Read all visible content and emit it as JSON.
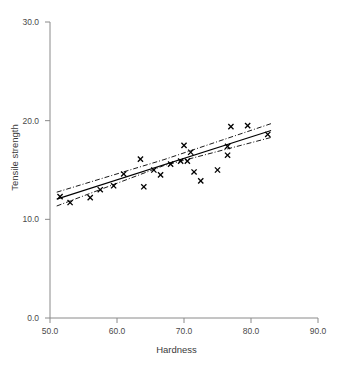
{
  "chart_data": {
    "type": "scatter",
    "title": "",
    "xlabel": "Hardness",
    "ylabel": "Tensile strength",
    "xlim": [
      50.0,
      90.0
    ],
    "ylim": [
      0.0,
      30.0
    ],
    "xticks": [
      "50.0",
      "60.0",
      "70.0",
      "80.0",
      "90.0"
    ],
    "yticks": [
      "0.0",
      "10.0",
      "20.0",
      "30.0"
    ],
    "xtick_values": [
      50,
      60,
      70,
      80,
      90
    ],
    "ytick_values": [
      0,
      10,
      20,
      30
    ],
    "grid": false,
    "legend": false,
    "marker": "x-cross",
    "marker_color": "#000000",
    "fit_line_color": "#000000",
    "band_color": "#000000",
    "band_style": "dash-dot",
    "points": [
      {
        "x": 51.5,
        "y": 12.3
      },
      {
        "x": 53.0,
        "y": 11.7
      },
      {
        "x": 56.0,
        "y": 12.2
      },
      {
        "x": 57.5,
        "y": 13.0
      },
      {
        "x": 59.5,
        "y": 13.4
      },
      {
        "x": 61.0,
        "y": 14.6
      },
      {
        "x": 63.5,
        "y": 16.1
      },
      {
        "x": 64.0,
        "y": 13.3
      },
      {
        "x": 65.5,
        "y": 15.0
      },
      {
        "x": 66.5,
        "y": 14.5
      },
      {
        "x": 68.0,
        "y": 15.6
      },
      {
        "x": 69.5,
        "y": 15.9
      },
      {
        "x": 70.0,
        "y": 17.5
      },
      {
        "x": 70.5,
        "y": 15.9
      },
      {
        "x": 71.0,
        "y": 16.8
      },
      {
        "x": 71.5,
        "y": 14.8
      },
      {
        "x": 72.5,
        "y": 13.9
      },
      {
        "x": 75.0,
        "y": 15.0
      },
      {
        "x": 76.5,
        "y": 17.4
      },
      {
        "x": 76.5,
        "y": 16.5
      },
      {
        "x": 77.0,
        "y": 19.4
      },
      {
        "x": 79.5,
        "y": 19.5
      },
      {
        "x": 82.5,
        "y": 18.6
      }
    ],
    "fit_line": {
      "x0": 51.0,
      "y0": 12.05,
      "x1": 83.0,
      "y1": 19.0
    },
    "upper_band": [
      {
        "x": 51.0,
        "y": 12.75
      },
      {
        "x": 67.0,
        "y": 16.05
      },
      {
        "x": 83.0,
        "y": 19.7
      }
    ],
    "lower_band": [
      {
        "x": 51.0,
        "y": 11.35
      },
      {
        "x": 67.0,
        "y": 15.45
      },
      {
        "x": 83.0,
        "y": 18.3
      }
    ]
  }
}
